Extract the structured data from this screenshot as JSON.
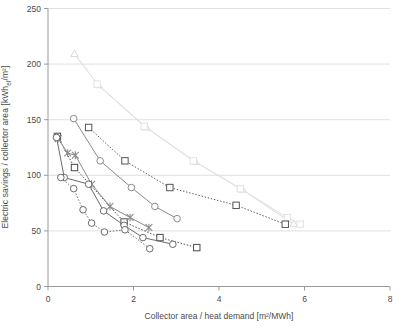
{
  "chart_data": {
    "type": "scatter",
    "title": "",
    "xlabel": "Collector area / heat demand [m²/MWh]",
    "ylabel_plain": "Electric savings / collector area [kWh_el/m²]",
    "ylabel_pre": "Electric savings / collector area [kWh",
    "ylabel_sub": "el",
    "ylabel_post": "/m²]",
    "xlim": [
      0,
      8
    ],
    "ylim": [
      0,
      250
    ],
    "xticks": [
      0,
      2,
      4,
      6,
      8
    ],
    "yticks": [
      0,
      50,
      100,
      150,
      200,
      250
    ],
    "xtick_labels": [
      "0",
      "2",
      "4",
      "6",
      "8"
    ],
    "ytick_labels": [
      "0",
      "50",
      "100",
      "150",
      "200",
      "250"
    ],
    "grid": "horizontal",
    "grid_color": "#d8d8d8",
    "axis_color": "#9a9a9a",
    "legend": "none",
    "series": [
      {
        "name": "series-1-triangle-light",
        "marker": "triangle",
        "line": "solid",
        "color": "#d9d9d9",
        "points": [
          {
            "x": 0.62,
            "y": 209
          },
          {
            "x": 1.18,
            "y": 181
          },
          {
            "x": 2.3,
            "y": 143
          },
          {
            "x": 3.45,
            "y": 112
          },
          {
            "x": 4.55,
            "y": 87
          },
          {
            "x": 5.75,
            "y": 56
          }
        ]
      },
      {
        "name": "series-2-square-light",
        "marker": "square",
        "line": "solid",
        "color": "#e2e2e2",
        "points": [
          {
            "x": 1.15,
            "y": 182
          },
          {
            "x": 2.25,
            "y": 144
          },
          {
            "x": 3.4,
            "y": 113
          },
          {
            "x": 4.5,
            "y": 88
          },
          {
            "x": 5.6,
            "y": 62
          },
          {
            "x": 5.9,
            "y": 56
          }
        ]
      },
      {
        "name": "series-3-square-dark",
        "marker": "square",
        "line": "dotted",
        "color": "#555555",
        "points": [
          {
            "x": 0.95,
            "y": 143
          },
          {
            "x": 1.8,
            "y": 113
          },
          {
            "x": 2.85,
            "y": 89
          },
          {
            "x": 4.4,
            "y": 73
          },
          {
            "x": 5.55,
            "y": 56
          }
        ]
      },
      {
        "name": "series-4-circle-mid",
        "marker": "circle",
        "line": "solid",
        "color": "#8a8a8a",
        "points": [
          {
            "x": 0.6,
            "y": 151
          },
          {
            "x": 1.22,
            "y": 113
          },
          {
            "x": 1.95,
            "y": 89
          },
          {
            "x": 2.5,
            "y": 72
          },
          {
            "x": 3.02,
            "y": 61
          }
        ]
      },
      {
        "name": "series-5-square-small-dark",
        "marker": "square",
        "line": "dotted",
        "color": "#4a4a4a",
        "points": [
          {
            "x": 0.22,
            "y": 135
          },
          {
            "x": 0.62,
            "y": 107
          },
          {
            "x": 1.78,
            "y": 58
          },
          {
            "x": 2.62,
            "y": 44
          },
          {
            "x": 3.48,
            "y": 35
          }
        ]
      },
      {
        "name": "series-6-cross",
        "marker": "cross",
        "line": "solid",
        "color": "#8a8a8a",
        "points": [
          {
            "x": 0.24,
            "y": 133
          },
          {
            "x": 0.46,
            "y": 120
          },
          {
            "x": 0.64,
            "y": 118
          },
          {
            "x": 1.02,
            "y": 92
          },
          {
            "x": 1.45,
            "y": 72
          },
          {
            "x": 1.92,
            "y": 62
          },
          {
            "x": 2.36,
            "y": 53
          }
        ]
      },
      {
        "name": "series-7-circle-dark",
        "marker": "circle",
        "line": "solid",
        "color": "#6b6b6b",
        "points": [
          {
            "x": 0.2,
            "y": 134
          },
          {
            "x": 0.38,
            "y": 98
          },
          {
            "x": 0.95,
            "y": 92
          },
          {
            "x": 1.3,
            "y": 68
          },
          {
            "x": 1.78,
            "y": 55
          },
          {
            "x": 2.22,
            "y": 44
          },
          {
            "x": 2.92,
            "y": 38
          }
        ]
      },
      {
        "name": "series-8-circle-dotted",
        "marker": "circle",
        "line": "dotted",
        "color": "#6b6b6b",
        "points": [
          {
            "x": 0.3,
            "y": 98
          },
          {
            "x": 0.6,
            "y": 88
          },
          {
            "x": 0.82,
            "y": 69
          },
          {
            "x": 1.02,
            "y": 57
          },
          {
            "x": 1.32,
            "y": 49
          },
          {
            "x": 1.8,
            "y": 51
          },
          {
            "x": 2.38,
            "y": 34
          }
        ]
      }
    ]
  }
}
